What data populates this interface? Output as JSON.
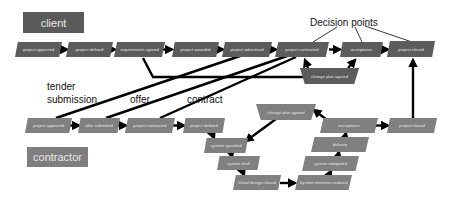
{
  "lanes": {
    "client": "client",
    "contractor": "contractor"
  },
  "annotations": {
    "decision_points": "Decision points",
    "tender_line1": "tender",
    "tender_line2": "submission",
    "offer": "offer",
    "contract": "contract"
  },
  "client_nodes": [
    {
      "id": "c1",
      "label": "project approved"
    },
    {
      "id": "c2",
      "label": "project defined"
    },
    {
      "id": "c3",
      "label": "requirements agreed"
    },
    {
      "id": "c4",
      "label": "project awarded"
    },
    {
      "id": "c5",
      "label": "project advertised"
    },
    {
      "id": "c6",
      "label": "project contracted"
    },
    {
      "id": "c7",
      "label": "acceptance"
    },
    {
      "id": "c8",
      "label": "project closed"
    },
    {
      "id": "c9",
      "label": "change plan agreed"
    }
  ],
  "contractor_nodes": [
    {
      "id": "k1",
      "label": "project approved"
    },
    {
      "id": "k2",
      "label": "offer submitted"
    },
    {
      "id": "k3",
      "label": "project contracted"
    },
    {
      "id": "k4",
      "label": "project defined"
    },
    {
      "id": "k5",
      "label": "system specified"
    },
    {
      "id": "k6",
      "label": "system draft"
    },
    {
      "id": "k7",
      "label": "Detail design closed"
    },
    {
      "id": "k8",
      "label": "System elements realized"
    },
    {
      "id": "k9",
      "label": "system integrated"
    },
    {
      "id": "k10",
      "label": "delivery"
    },
    {
      "id": "k11",
      "label": "acceptance"
    },
    {
      "id": "k12",
      "label": "change plan agreed"
    },
    {
      "id": "k13",
      "label": "project closed"
    }
  ],
  "colors": {
    "client_node": "#5c5c5c",
    "contractor_node": "#808080",
    "arrow": "#000000"
  }
}
